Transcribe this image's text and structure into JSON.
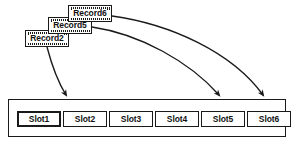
{
  "diagram": {
    "type": "mapping-diagram",
    "background_color": "#ffffff",
    "line_color": "#1a1a1a",
    "records": [
      {
        "label": "Record6",
        "x": 68,
        "y": 5,
        "width": 44,
        "z": 3
      },
      {
        "label": "Record5",
        "x": 48,
        "y": 17,
        "width": 44,
        "z": 2
      },
      {
        "label": "Record2",
        "x": 25,
        "y": 30,
        "width": 44,
        "z": 1
      }
    ],
    "container": {
      "name": "slot-container",
      "x": 8,
      "y": 99,
      "width": 278,
      "height": 38
    },
    "slots": [
      {
        "label": "Slot1",
        "x": 16,
        "width": 44,
        "highlighted": true
      },
      {
        "label": "Slot2",
        "x": 62,
        "width": 44,
        "highlighted": false
      },
      {
        "label": "Slot3",
        "x": 108,
        "width": 44,
        "highlighted": false
      },
      {
        "label": "Slot4",
        "x": 154,
        "width": 44,
        "highlighted": false
      },
      {
        "label": "Slot5",
        "x": 200,
        "width": 44,
        "highlighted": false
      },
      {
        "label": "Slot6",
        "x": 246,
        "width": 44,
        "highlighted": false
      }
    ],
    "arrows": [
      {
        "from": "Record2",
        "to": "Slot2",
        "path": "M 47 47 C 52 66, 58 82, 66 95"
      },
      {
        "from": "Record5",
        "to": "Slot5",
        "path": "M 92 27 C 140 34, 190 62, 219 95"
      },
      {
        "from": "Record6",
        "to": "Slot6",
        "path": "M 112 16 C 170 24, 232 52, 263 95"
      }
    ]
  }
}
